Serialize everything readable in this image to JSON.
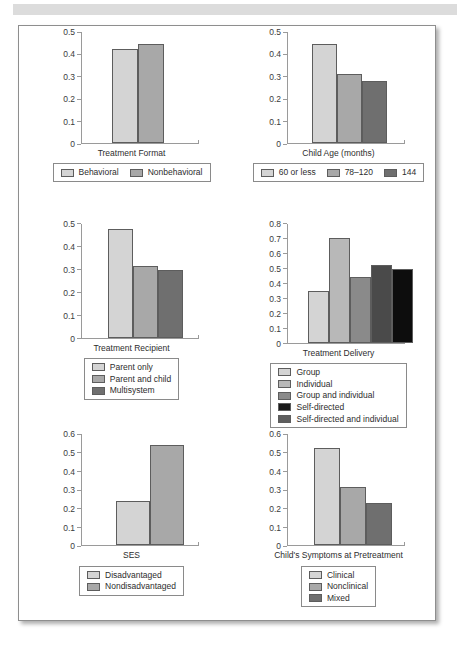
{
  "page": {
    "background_color": "#ffffff",
    "sheet_border_color": "#8e8e8e",
    "top_band_color": "#dcdcdc"
  },
  "palette": {
    "g1": "#d4d4d4",
    "g2": "#b0b0b0",
    "g3": "#8b8b8b",
    "g4": "#4a4a4a",
    "g5": "#0d0d0d",
    "bar_outline": "#5d5d5d",
    "axis": "#9a9a9a",
    "text": "#2d2d2d"
  },
  "chart_data": [
    {
      "id": "treatment-format",
      "type": "bar",
      "title": "",
      "xlabel": "Treatment Format",
      "ylabel": "",
      "ylim": [
        0,
        0.5
      ],
      "yticks": [
        "0",
        "0.1",
        "0.2",
        "0.3",
        "0.4",
        "0.5"
      ],
      "ytick_values": [
        0,
        0.1,
        0.2,
        0.3,
        0.4,
        0.5
      ],
      "grid": false,
      "legend_position": "bottom",
      "legend_layout": "horizontal",
      "categories": [
        "Behavioral",
        "Nonbehavioral"
      ],
      "values": [
        0.42,
        0.44
      ],
      "colors": [
        "#d4d4d4",
        "#a8a8a8"
      ]
    },
    {
      "id": "child-age-months",
      "type": "bar",
      "title": "",
      "xlabel": "Child Age (months)",
      "ylabel": "",
      "ylim": [
        0,
        0.5
      ],
      "yticks": [
        "0",
        "0.1",
        "0.2",
        "0.3",
        "0.4",
        "0.5"
      ],
      "ytick_values": [
        0,
        0.1,
        0.2,
        0.3,
        0.4,
        0.5
      ],
      "grid": false,
      "legend_position": "bottom",
      "legend_layout": "horizontal",
      "categories": [
        "60 or less",
        "78–120",
        "144"
      ],
      "values": [
        0.44,
        0.31,
        0.275
      ],
      "colors": [
        "#d4d4d4",
        "#a8a8a8",
        "#6f6f6f"
      ]
    },
    {
      "id": "treatment-recipient",
      "type": "bar",
      "title": "",
      "xlabel": "Treatment Recipient",
      "ylabel": "",
      "ylim": [
        0,
        0.5
      ],
      "yticks": [
        "0",
        "0.1",
        "0.2",
        "0.3",
        "0.4",
        "0.5"
      ],
      "ytick_values": [
        0,
        0.1,
        0.2,
        0.3,
        0.4,
        0.5
      ],
      "grid": false,
      "legend_position": "bottom",
      "legend_layout": "vertical",
      "categories": [
        "Parent only",
        "Parent and child",
        "Multisystem"
      ],
      "values": [
        0.475,
        0.312,
        0.295
      ],
      "colors": [
        "#d4d4d4",
        "#a8a8a8",
        "#6f6f6f"
      ]
    },
    {
      "id": "treatment-delivery",
      "type": "bar",
      "title": "",
      "xlabel": "Treatment Delivery",
      "ylabel": "",
      "ylim": [
        0,
        0.8
      ],
      "yticks": [
        "0",
        "0.1",
        "0.2",
        "0.3",
        "0.4",
        "0.5",
        "0.6",
        "0.7",
        "0.8"
      ],
      "ytick_values": [
        0,
        0.1,
        0.2,
        0.3,
        0.4,
        0.5,
        0.6,
        0.7,
        0.8
      ],
      "grid": false,
      "legend_position": "bottom",
      "legend_layout": "vertical",
      "categories": [
        "Group",
        "Individual",
        "Group and individual",
        "Self-directed",
        "Self-directed and individual"
      ],
      "values": [
        0.345,
        0.7,
        0.44,
        0.52,
        0.49
      ],
      "colors": [
        "#d4d4d4",
        "#b8b8b8",
        "#8a8a8a",
        "#4a4a4a",
        "#0d0d0d"
      ],
      "legend_colors": [
        "#d4d4d4",
        "#b8b8b8",
        "#8a8a8a",
        "#1a1a1a",
        "#5e5e5e"
      ]
    },
    {
      "id": "ses",
      "type": "bar",
      "title": "",
      "xlabel": "SES",
      "ylabel": "",
      "ylim": [
        0,
        0.6
      ],
      "yticks": [
        "0",
        "0.1",
        "0.2",
        "0.3",
        "0.4",
        "0.5",
        "0.6"
      ],
      "ytick_values": [
        0,
        0.1,
        0.2,
        0.3,
        0.4,
        0.5,
        0.6
      ],
      "grid": false,
      "legend_position": "bottom",
      "legend_layout": "vertical",
      "categories": [
        "Disadvantaged",
        "Nondisadvantaged"
      ],
      "values": [
        0.238,
        0.538
      ],
      "colors": [
        "#d4d4d4",
        "#a8a8a8"
      ]
    },
    {
      "id": "childs-symptoms-at-pretreatment",
      "type": "bar",
      "title": "",
      "xlabel": "Child's Symptoms at Pretreatment",
      "ylabel": "",
      "ylim": [
        0,
        0.6
      ],
      "yticks": [
        "0",
        "0.1",
        "0.2",
        "0.3",
        "0.4",
        "0.5",
        "0.6"
      ],
      "ytick_values": [
        0,
        0.1,
        0.2,
        0.3,
        0.4,
        0.5,
        0.6
      ],
      "grid": false,
      "legend_position": "bottom",
      "legend_layout": "vertical",
      "categories": [
        "Clinical",
        "Nonclinical",
        "Mixed"
      ],
      "values": [
        0.522,
        0.312,
        0.225
      ],
      "colors": [
        "#d4d4d4",
        "#a8a8a8",
        "#6f6f6f"
      ]
    }
  ]
}
